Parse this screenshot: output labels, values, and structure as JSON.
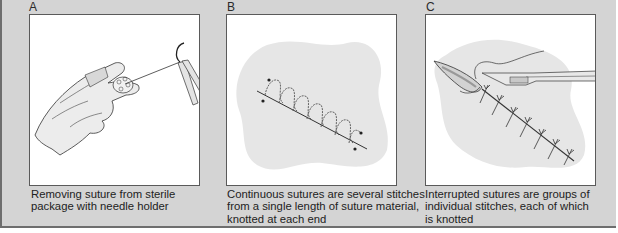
{
  "panels": [
    {
      "letter": "A",
      "caption_lines": [
        "Removing suture from sterile",
        "package with needle holder"
      ],
      "illustration": "hand-holding-suture-package-with-needle-holder"
    },
    {
      "letter": "B",
      "caption_lines": [
        "Continuous sutures are several stitches",
        "from a single length of suture material,",
        "knotted at each end"
      ],
      "illustration": "continuous-suture-on-skin-patch"
    },
    {
      "letter": "C",
      "caption_lines": [
        "Interrupted sutures are groups of",
        "individual stitches, each of which",
        "is knotted"
      ],
      "illustration": "interrupted-sutures-with-needle-holder"
    }
  ],
  "colors": {
    "background": "#d4d4d4",
    "frame_border": "#5a5a5a",
    "skin_patch": "#e6e6e6",
    "line_art": "#333333"
  }
}
